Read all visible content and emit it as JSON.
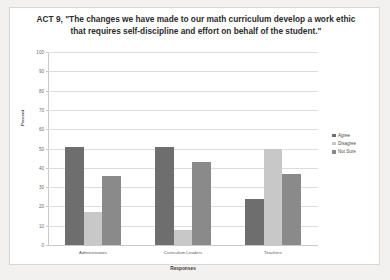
{
  "chart_data": {
    "type": "bar",
    "title": "ACT 9, \"The changes we have made to our math curriculum develop a work ethic that requires self-discipline and effort on behalf of the student.\"",
    "xlabel": "Responses",
    "ylabel": "Percent",
    "ylim": [
      0,
      100
    ],
    "yticks": [
      100,
      90,
      80,
      70,
      60,
      50,
      40,
      30,
      20,
      10,
      0
    ],
    "grid": true,
    "legend_position": "right",
    "categories": [
      "Administrators",
      "Curriculum Leaders",
      "Teachers"
    ],
    "series": [
      {
        "name": "Agree",
        "color": "#6e6e6e",
        "values": [
          51,
          51,
          24
        ]
      },
      {
        "name": "Disagree",
        "color": "#c8c8c8",
        "values": [
          17,
          8,
          50
        ]
      },
      {
        "name": "Not Sure",
        "color": "#8a8a8a",
        "values": [
          36,
          43,
          37
        ]
      }
    ]
  },
  "page": {
    "background": "#f2f1ef",
    "card_background": "#ffffff"
  }
}
